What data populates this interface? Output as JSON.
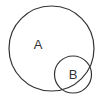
{
  "diagram": {
    "type": "venn",
    "sets": [
      {
        "label": "A",
        "cx": 51.5,
        "cy": 48.5,
        "r": 42.5
      },
      {
        "label": "B",
        "cx": 73,
        "cy": 74.5,
        "r": 18.5
      }
    ],
    "stroke_color": "#333333",
    "background": "#ffffff"
  }
}
